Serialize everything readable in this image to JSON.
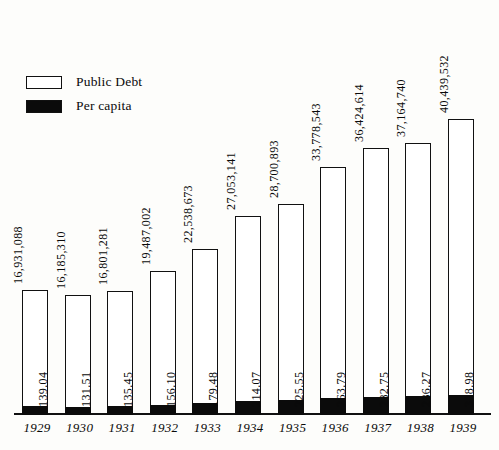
{
  "legend": {
    "items": [
      {
        "label": "Public Debt",
        "style": "hollow",
        "color": "#ffffff"
      },
      {
        "label": "Per capita",
        "style": "filled",
        "color": "#0b0b0b"
      }
    ]
  },
  "chart_data": {
    "type": "bar",
    "title": "",
    "xlabel": "",
    "ylabel": "",
    "grid": false,
    "legend_position": "top-left",
    "categories": [
      "1929",
      "1930",
      "1931",
      "1932",
      "1933",
      "1934",
      "1935",
      "1936",
      "1937",
      "1938",
      "1939"
    ],
    "series": [
      {
        "name": "Public Debt",
        "value_labels": [
          "16,931,088",
          "16,185,310",
          "16,801,281",
          "19,487,002",
          "22,538,673",
          "27,053,141",
          "28,700,893",
          "33,778,543",
          "36,424,614",
          "37,164,740",
          "40,439,532"
        ],
        "values": [
          16931088,
          16185310,
          16801281,
          19487002,
          22538673,
          27053141,
          28700893,
          33778543,
          36424614,
          37164740,
          40439532
        ]
      },
      {
        "name": "Per capita",
        "value_labels": [
          "139.04",
          "131.51",
          "135.45",
          "156.10",
          "179.48",
          "214.07",
          "225.55",
          "263.79",
          "282.75",
          "286.27",
          "308.98"
        ],
        "values": [
          139.04,
          131.51,
          135.45,
          156.1,
          179.48,
          214.07,
          225.55,
          263.79,
          282.75,
          286.27,
          308.98
        ]
      }
    ],
    "ylim": [
      0,
      44000000
    ],
    "ylim_secondary": [
      0,
      340
    ]
  }
}
